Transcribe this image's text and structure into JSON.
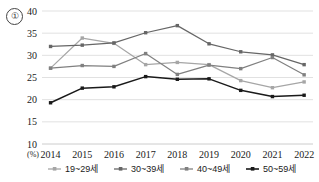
{
  "annotation": {
    "circled_number": "①"
  },
  "chart_data": {
    "type": "line",
    "title": "",
    "xlabel": "",
    "ylabel": "",
    "unit_label": "(%)",
    "grid": true,
    "legend_position": "bottom",
    "ylim": [
      10,
      40
    ],
    "yticks": [
      10,
      15,
      20,
      25,
      30,
      35,
      40
    ],
    "ytick_labels": [
      "10",
      "15",
      "20",
      "25",
      "30",
      "35",
      "40"
    ],
    "categories": [
      "2014",
      "2015",
      "2016",
      "2017",
      "2018",
      "2019",
      "2020",
      "2021",
      "2022"
    ],
    "series": [
      {
        "name": "19~29세",
        "color": "#a6a6a6",
        "values": [
          27.1,
          33.9,
          32.7,
          27.9,
          28.4,
          27.9,
          24.3,
          22.7,
          24.0
        ]
      },
      {
        "name": "30~39세",
        "color": "#666666",
        "values": [
          32.0,
          32.3,
          32.8,
          35.1,
          36.7,
          32.6,
          30.8,
          30.1,
          27.9
        ]
      },
      {
        "name": "40~49세",
        "color": "#808080",
        "values": [
          27.1,
          27.7,
          27.5,
          30.4,
          25.7,
          27.8,
          27.0,
          29.5,
          25.6
        ]
      },
      {
        "name": "50~59세",
        "color": "#1a1a1a",
        "values": [
          19.3,
          22.6,
          22.9,
          25.2,
          24.6,
          24.7,
          22.1,
          20.7,
          21.0
        ]
      }
    ]
  }
}
